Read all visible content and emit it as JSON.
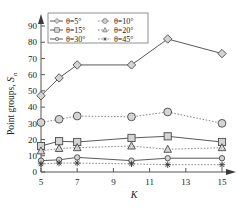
{
  "chart_data": {
    "type": "line",
    "title": "",
    "xlabel": "K",
    "ylabel": "Point groups,S",
    "ylabel_sub": "n",
    "x": [
      5,
      6,
      7,
      10,
      12,
      15
    ],
    "xlim": [
      5,
      15
    ],
    "ylim": [
      0,
      90
    ],
    "xticks": [
      5,
      7,
      9,
      11,
      13,
      15
    ],
    "yticks": [
      0,
      10,
      20,
      30,
      40,
      50,
      60,
      70,
      80,
      90
    ],
    "grid": false,
    "legend_position": "top-left-inside",
    "series": [
      {
        "name": "θ=5°",
        "marker": "diamond",
        "line": "solid",
        "values": [
          47,
          58,
          66,
          66,
          82,
          73
        ]
      },
      {
        "name": "θ=10°",
        "marker": "circle-large",
        "line": "dotted",
        "values": [
          30.5,
          32.5,
          34.5,
          34,
          37,
          30
        ]
      },
      {
        "name": "θ=15°",
        "marker": "square",
        "line": "solid",
        "values": [
          16,
          19,
          18.5,
          21,
          22,
          18.5
        ]
      },
      {
        "name": "θ=20°",
        "marker": "triangle",
        "line": "dotted",
        "values": [
          13,
          14.5,
          15,
          16,
          14,
          15
        ]
      },
      {
        "name": "θ=30°",
        "marker": "circle-small",
        "line": "solid",
        "values": [
          7,
          7.5,
          9,
          7,
          8.5,
          8.5
        ]
      },
      {
        "name": "θ=45°",
        "marker": "star",
        "line": "dotted",
        "values": [
          5,
          5.5,
          5.5,
          5,
          4.5,
          4.5
        ]
      }
    ]
  },
  "axis": {
    "y_ticks_text": [
      "0",
      "10",
      "20",
      "30",
      "40",
      "50",
      "60",
      "70",
      "80",
      "90"
    ],
    "x_ticks_text": [
      "5",
      "7",
      "9",
      "11",
      "13",
      "15"
    ],
    "x_title": "K",
    "y_title": "Point groups,",
    "y_title_italic": "S",
    "y_title_sub": "n"
  },
  "legend": {
    "entries": [
      {
        "label": "θ=5°",
        "icon": "diamond-marker-icon"
      },
      {
        "label": "θ=10°",
        "icon": "circle-large-marker-icon"
      },
      {
        "label": "θ=15°",
        "icon": "square-marker-icon"
      },
      {
        "label": "θ=20°",
        "icon": "triangle-marker-icon"
      },
      {
        "label": "θ=30°",
        "icon": "circle-small-marker-icon"
      },
      {
        "label": "θ=45°",
        "icon": "star-marker-icon"
      }
    ]
  },
  "colors": {
    "axis": "#555555",
    "line_solid": "#5a5a5a",
    "line_dotted": "#8a8a8a",
    "marker_fill": "#d4d4d4",
    "marker_stroke": "#4a4a4a",
    "background": "#ffffff"
  }
}
